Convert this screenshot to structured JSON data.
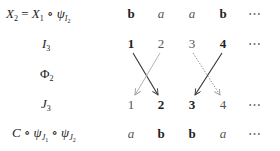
{
  "rows": [
    {
      "label_html": "X2 = X1 ∘ ψI2",
      "label": "X_2 = X_1 ∘ ψ_{I_2}",
      "cells": [
        {
          "t": "b",
          "s": "bold"
        },
        {
          "t": "a",
          "s": "ital"
        },
        {
          "t": "a",
          "s": "ital"
        },
        {
          "t": "b",
          "s": "bold"
        },
        {
          "t": "⋯",
          "s": "dots"
        }
      ]
    },
    {
      "label": "I_3",
      "cells": [
        {
          "t": "1",
          "s": "bold"
        },
        {
          "t": "2",
          "s": "plain"
        },
        {
          "t": "3",
          "s": "plain"
        },
        {
          "t": "4",
          "s": "bold"
        },
        {
          "t": "⋯",
          "s": "dots"
        }
      ]
    },
    {
      "label": "Φ_2",
      "cells": []
    },
    {
      "label": "J_3",
      "cells": [
        {
          "t": "1",
          "s": "plain"
        },
        {
          "t": "2",
          "s": "bold"
        },
        {
          "t": "3",
          "s": "bold"
        },
        {
          "t": "4",
          "s": "plain"
        },
        {
          "t": "⋯",
          "s": "dots"
        }
      ]
    },
    {
      "label": "C ∘ ψ_{J_1} ∘ ψ_{J_2}",
      "cells": [
        {
          "t": "a",
          "s": "ital"
        },
        {
          "t": "b",
          "s": "bold"
        },
        {
          "t": "b",
          "s": "bold"
        },
        {
          "t": "a",
          "s": "ital"
        },
        {
          "t": "⋯",
          "s": "dots"
        }
      ]
    }
  ],
  "texts": {
    "r0c0": "b",
    "r0c1": "a",
    "r0c2": "a",
    "r0c3": "b",
    "r0c4": "⋯",
    "r1c0": "1",
    "r1c1": "2",
    "r1c2": "3",
    "r1c3": "4",
    "r1c4": "⋯",
    "r3c0": "1",
    "r3c1": "2",
    "r3c2": "3",
    "r3c3": "4",
    "r3c4": "⋯",
    "r4c0": "a",
    "r4c1": "b",
    "r4c2": "b",
    "r4c3": "a",
    "r4c4": "⋯"
  },
  "arrows": [
    {
      "from": "I3.1",
      "to": "J3.2",
      "style": "solid"
    },
    {
      "from": "I3.2",
      "to": "J3.1",
      "style": "faint"
    },
    {
      "from": "I3.3",
      "to": "J3.4",
      "style": "dotted"
    },
    {
      "from": "I3.4",
      "to": "J3.3",
      "style": "solid"
    }
  ]
}
